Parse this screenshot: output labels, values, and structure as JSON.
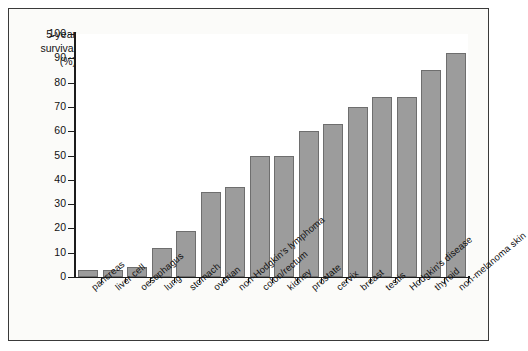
{
  "chart_data": {
    "type": "bar",
    "title": "",
    "xlabel": "",
    "ylabel": "5-year survival (%)",
    "ylabel_lines": [
      "5-year",
      "survival",
      "(%)"
    ],
    "ylim": [
      0,
      100
    ],
    "ytick_step": 10,
    "yticks": [
      0,
      10,
      20,
      30,
      40,
      50,
      60,
      70,
      80,
      90,
      100
    ],
    "grid": false,
    "legend": false,
    "bar_color": "#9c9c9c",
    "bar_edge_color": "#6e6e6e",
    "categories": [
      "pancreas",
      "liver cell",
      "oesophagus",
      "lung",
      "stomach",
      "ovarian",
      "non-Hodgkin's lymphoma",
      "colon/rectum",
      "kidney",
      "prostate",
      "cervix",
      "breast",
      "testis",
      "Hodgkin's disease",
      "thyroid",
      "non-melanoma skin"
    ],
    "values": [
      3,
      3,
      4,
      12,
      19,
      35,
      37,
      50,
      50,
      60,
      63,
      70,
      74,
      74,
      85,
      92
    ]
  }
}
